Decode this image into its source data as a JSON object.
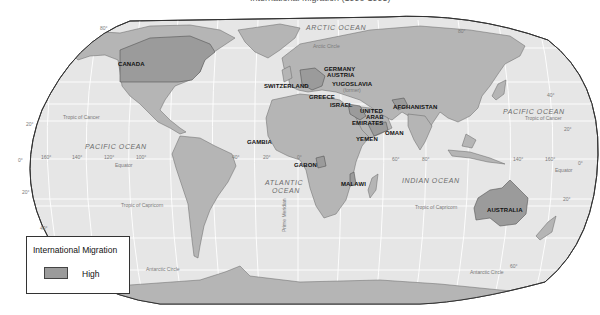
{
  "title": "International Migration (1990-1995)",
  "colors": {
    "ocean": "#e6e6e6",
    "land": "#b5b5b5",
    "high_migration": "#9b9b9b",
    "border": "#555555",
    "grid": "#ffffff",
    "outline": "#333333"
  },
  "countries_high": [
    {
      "name": "CANADA"
    },
    {
      "name": "SWITZERLAND"
    },
    {
      "name": "GERMANY"
    },
    {
      "name": "AUSTRIA"
    },
    {
      "name": "YUGOSLAVIA"
    },
    {
      "name": "(former)"
    },
    {
      "name": "GREECE"
    },
    {
      "name": "ISRAEL"
    },
    {
      "name": "UNITED"
    },
    {
      "name": "ARAB"
    },
    {
      "name": "EMIRATES"
    },
    {
      "name": "AFGHANISTAN"
    },
    {
      "name": "OMAN"
    },
    {
      "name": "YEMEN"
    },
    {
      "name": "GAMBIA"
    },
    {
      "name": "GABON"
    },
    {
      "name": "MALAWI"
    },
    {
      "name": "AUSTRALIA"
    }
  ],
  "oceans": {
    "arctic": "ARCTIC OCEAN",
    "pacific_west": "PACIFIC OCEAN",
    "pacific_east": "PACIFIC OCEAN",
    "atlantic_1": "ATLANTIC",
    "atlantic_2": "OCEAN",
    "indian": "INDIAN OCEAN"
  },
  "reference_lines": {
    "arctic_circle": "Arctic Circle",
    "tropic_cancer_w": "Tropic of Cancer",
    "tropic_cancer_e": "Tropic of Cancer",
    "equator_w": "Equator",
    "equator_e": "Equator",
    "tropic_capricorn_w": "Tropic of Capricorn",
    "tropic_capricorn_e": "Tropic of Capricorn",
    "antarctic_circle_w": "Antarctic Circle",
    "antarctic_circle_e": "Antarctic Circle",
    "prime_meridian": "Prime Meridian"
  },
  "degrees": {
    "n80_w": "80°",
    "n80_e": "80°",
    "n40_e": "40°",
    "n20_w": "20°",
    "n20_e": "20°",
    "zero_w": "0°",
    "zero_e": "0°",
    "lon160w": "160°",
    "lon140w": "140°",
    "lon120w": "120°",
    "lon100w": "100°",
    "lon40w": "40°",
    "lon20w": "20°",
    "lon0": "0°",
    "lon60e": "60°",
    "lon80e": "80°",
    "lon140e": "140°",
    "lon160e": "160°",
    "s20_w": "20°",
    "s20_e": "20°",
    "s40_w": "40°",
    "s60_e": "60°"
  },
  "legend": {
    "title": "International Migration",
    "items": [
      {
        "label": "High",
        "color": "#9b9b9b"
      }
    ]
  }
}
